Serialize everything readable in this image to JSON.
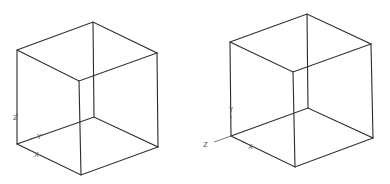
{
  "figure": {
    "colors": {
      "edge": "#2a2a2a",
      "axis": "#555555",
      "background": "#ffffff"
    }
  },
  "cubes": [
    {
      "name": "left-cube",
      "vertices": {
        "top_left": [
          17,
          50
        ],
        "top_back": [
          93,
          22
        ],
        "top_right": [
          157,
          53
        ],
        "top_front": [
          79,
          81
        ],
        "bottom_left": [
          17,
          144
        ],
        "bottom_back": [
          94,
          117
        ],
        "bottom_right": [
          158,
          147
        ],
        "bottom_front": [
          81,
          175
        ]
      },
      "axis_labels": {
        "z": "Z",
        "y": "Y",
        "x": "X"
      }
    },
    {
      "name": "right-cube",
      "vertices": {
        "top_left": [
          230,
          42
        ],
        "top_back": [
          307,
          14
        ],
        "top_right": [
          371,
          44
        ],
        "top_front": [
          293,
          72
        ],
        "bottom_left": [
          231,
          136
        ],
        "bottom_back": [
          308,
          108
        ],
        "bottom_right": [
          373,
          138
        ],
        "bottom_front": [
          295,
          167
        ]
      },
      "axis_labels": {
        "y": "Y",
        "z": "Z",
        "x": "X"
      }
    }
  ]
}
